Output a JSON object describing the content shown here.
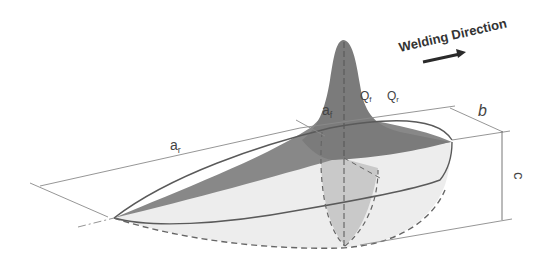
{
  "diagram": {
    "direction_label": "Welding Direction",
    "labels": {
      "a_rear": "a",
      "a_rear_sub": "r",
      "a_front": "a",
      "a_front_sub": "f",
      "b": "b",
      "c": "c",
      "q_front": "Q",
      "q_front_sub": "f",
      "q_rear": "Q",
      "q_rear_sub": "r"
    },
    "colors": {
      "heat_peak": "#7d7d7d",
      "rear_top_surface": "#8a8a8a",
      "front_cross_section": "#c8c8c8",
      "body_fill": "#ececec",
      "outline": "#5a5a5a",
      "dimension_line": "#8a8a8a",
      "arrow": "#2a2a2a"
    }
  }
}
